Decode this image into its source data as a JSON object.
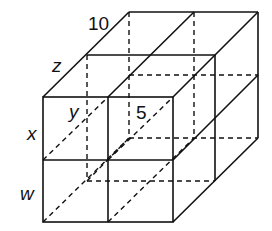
{
  "diagram": {
    "type": "2x2x2 cube block (isometric wireframe)",
    "labels": {
      "top_edge": "10",
      "depth_edge": "z",
      "inner": "y",
      "inner_number": "5",
      "upper_height": "x",
      "lower_height": "w"
    }
  }
}
